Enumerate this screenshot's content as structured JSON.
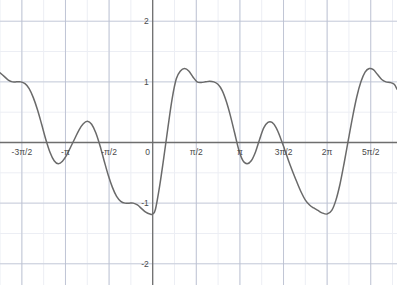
{
  "chart_data": {
    "type": "line",
    "title": "",
    "subtitle": "",
    "xlabel": "",
    "ylabel": "",
    "xlim": [
      -5.5,
      8.8
    ],
    "ylim": [
      -2.35,
      2.35
    ],
    "grid": true,
    "minor_grid": true,
    "legend": "none",
    "axis_color": "#6e6e6e",
    "grid_color": "#b9bfd0",
    "minor_grid_color": "#eceef4",
    "curve_color": "#6a6a6a",
    "label_color": "#4a4a4a",
    "background": "#ffffff",
    "x_ticks": [
      {
        "value": -4.71238898,
        "label": "-3π/2"
      },
      {
        "value": -3.141592653,
        "label": "-π"
      },
      {
        "value": -1.570796327,
        "label": "-π/2"
      },
      {
        "value": 0.0,
        "label": "0"
      },
      {
        "value": 1.570796327,
        "label": "π/2"
      },
      {
        "value": 3.141592653,
        "label": "π"
      },
      {
        "value": 4.71238898,
        "label": "3π/2"
      },
      {
        "value": 6.283185307,
        "label": "2π"
      },
      {
        "value": 7.853981634,
        "label": "5π/2"
      }
    ],
    "y_ticks": [
      {
        "value": 2,
        "label": "2"
      },
      {
        "value": 1,
        "label": "1"
      },
      {
        "value": 0,
        "label": "0"
      },
      {
        "value": -1,
        "label": "-1"
      },
      {
        "value": -2,
        "label": "-2"
      }
    ],
    "series": [
      {
        "name": "y = sin(x) + (1/3)sin(3x)",
        "expression": "sin(x)+sin(3x)/3",
        "color": "#6a6a6a",
        "x": [
          -5.5,
          -5.35,
          -5.2,
          -5.05,
          -4.9,
          -4.75,
          -4.6,
          -4.45,
          -4.3,
          -4.15,
          -4.0,
          -3.85,
          -3.7,
          -3.55,
          -3.4,
          -3.25,
          -3.1,
          -2.95,
          -2.8,
          -2.65,
          -2.5,
          -2.35,
          -2.2,
          -2.05,
          -1.9,
          -1.75,
          -1.6,
          -1.45,
          -1.3,
          -1.15,
          -1.0,
          -0.85,
          -0.7,
          -0.55,
          -0.4,
          -0.25,
          -0.1,
          0.0,
          0.1,
          0.25,
          0.4,
          0.55,
          0.7,
          0.85,
          1.0,
          1.15,
          1.3,
          1.45,
          1.6,
          1.75,
          1.9,
          2.05,
          2.2,
          2.35,
          2.5,
          2.65,
          2.8,
          2.95,
          3.1,
          3.25,
          3.4,
          3.55,
          3.7,
          3.85,
          4.0,
          4.15,
          4.3,
          4.45,
          4.6,
          4.75,
          4.9,
          5.05,
          5.2,
          5.35,
          5.5,
          5.65,
          5.8,
          5.95,
          6.1,
          6.28,
          6.45,
          6.6,
          6.75,
          6.9,
          7.05,
          7.2,
          7.35,
          7.5,
          7.65,
          7.8,
          7.95,
          8.1,
          8.25,
          8.4,
          8.55,
          8.7,
          8.8
        ],
        "y": [
          1.15,
          1.09,
          1.03,
          1.0,
          1.0,
          1.0,
          0.97,
          0.89,
          0.74,
          0.54,
          0.3,
          0.05,
          -0.16,
          -0.3,
          -0.35,
          -0.31,
          -0.21,
          -0.07,
          0.07,
          0.21,
          0.31,
          0.35,
          0.3,
          0.16,
          -0.05,
          -0.3,
          -0.54,
          -0.74,
          -0.89,
          -0.97,
          -1.0,
          -1.0,
          -1.0,
          -1.03,
          -1.09,
          -1.15,
          -1.18,
          -1.18,
          -1.1,
          -0.72,
          -0.25,
          0.25,
          0.72,
          1.05,
          1.18,
          1.22,
          1.18,
          1.08,
          1.0,
          0.99,
          1.0,
          1.01,
          1.0,
          0.96,
          0.86,
          0.68,
          0.44,
          0.16,
          -0.12,
          -0.3,
          -0.35,
          -0.3,
          -0.16,
          0.05,
          0.24,
          0.33,
          0.33,
          0.24,
          0.08,
          -0.11,
          -0.31,
          -0.49,
          -0.66,
          -0.82,
          -0.95,
          -1.03,
          -1.08,
          -1.12,
          -1.16,
          -1.18,
          -1.12,
          -0.95,
          -0.68,
          -0.33,
          0.05,
          0.42,
          0.75,
          1.0,
          1.16,
          1.22,
          1.2,
          1.12,
          1.04,
          1.0,
          0.99,
          0.96,
          0.88
        ]
      }
    ],
    "annotations": {
      "peak_max": 1.22,
      "plateau_value": 1.0,
      "trough_min": -1.22,
      "secondary_bump": 0.35,
      "period": "2π"
    }
  }
}
